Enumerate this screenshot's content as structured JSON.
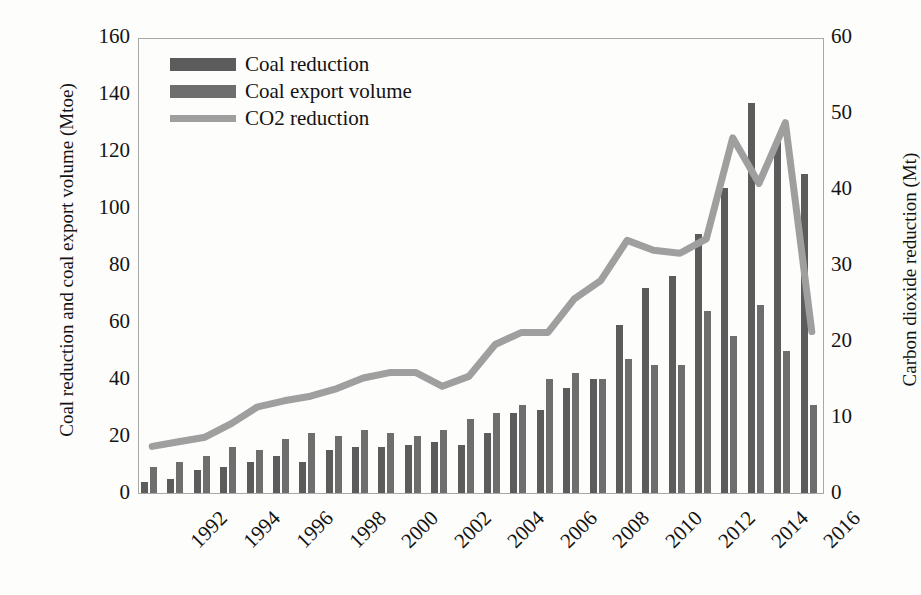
{
  "chart_data": {
    "type": "bar",
    "title": "",
    "xlabel": "",
    "ylabel": "Coal reduction and coal export volume (Mtoe)",
    "y2label": "Carbon dioxide reduction (Mt)",
    "ylim": [
      0,
      160
    ],
    "y2lim": [
      0,
      60
    ],
    "ytick_labels": [
      "160",
      "140",
      "120",
      "100",
      "80",
      "60",
      "40",
      "20",
      "0"
    ],
    "y2tick_labels": [
      "60",
      "50",
      "40",
      "30",
      "20",
      "10",
      "0"
    ],
    "ytick_values": [
      160,
      140,
      120,
      100,
      80,
      60,
      40,
      20,
      0
    ],
    "y2tick_values": [
      60,
      50,
      40,
      30,
      20,
      10,
      0
    ],
    "grid": false,
    "legend_position": "top-left",
    "categories": [
      1992,
      1993,
      1994,
      1995,
      1996,
      1997,
      1998,
      1999,
      2000,
      2001,
      2002,
      2003,
      2004,
      2005,
      2006,
      2007,
      2008,
      2009,
      2010,
      2011,
      2012,
      2013,
      2014,
      2015,
      2016,
      2017
    ],
    "xtick_labels": [
      "1992",
      "1994",
      "1996",
      "1998",
      "2000",
      "2002",
      "2004",
      "2006",
      "2008",
      "2010",
      "2012",
      "2014",
      "2016"
    ],
    "series": [
      {
        "name": "Coal reduction",
        "kind": "bar",
        "axis": "left",
        "color": "#5c5c5c",
        "values": [
          4,
          5,
          8,
          9,
          11,
          13,
          11,
          15,
          16,
          16,
          17,
          18,
          17,
          21,
          28,
          29,
          37,
          40,
          59,
          72,
          76,
          91,
          107,
          137,
          123,
          112
        ]
      },
      {
        "name": "Coal export volume",
        "kind": "bar",
        "axis": "left",
        "color": "#6e6e6e",
        "values": [
          9,
          11,
          13,
          16,
          15,
          19,
          21,
          20,
          22,
          21,
          20,
          22,
          26,
          28,
          31,
          40,
          42,
          40,
          47,
          45,
          45,
          64,
          55,
          66,
          50,
          31
        ]
      },
      {
        "name": "CO2 reduction",
        "kind": "line",
        "axis": "right",
        "color": "#9f9f9f",
        "values": [
          6.4,
          7.0,
          7.6,
          9.4,
          11.6,
          12.4,
          13.0,
          14.0,
          15.4,
          16.1,
          16.1,
          14.3,
          15.6,
          19.8,
          21.4,
          21.4,
          25.8,
          28.2,
          33.5,
          32.2,
          31.8,
          33.7,
          47.0,
          41.0,
          49.0,
          21.5
        ]
      }
    ],
    "legend": [
      {
        "label": "Coal reduction",
        "swatch": "bar",
        "color": "#5c5c5c"
      },
      {
        "label": "Coal export volume",
        "swatch": "bar",
        "color": "#6e6e6e"
      },
      {
        "label": "CO2 reduction",
        "swatch": "line",
        "color": "#9f9f9f"
      }
    ]
  }
}
